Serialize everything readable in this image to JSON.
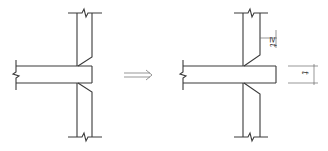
{
  "figure": {
    "left_detail": {
      "name": "original-joint",
      "description": "Wall with slab end flush to wall face, haunches at both slab faces"
    },
    "arrow": {
      "symbol": "⟹",
      "meaning": "transforms-to"
    },
    "right_detail": {
      "name": "modified-joint",
      "description": "Slab extended beyond wall face, haunches moved up",
      "dimensions": [
        {
          "label": "≥t",
          "meaning": "haunch offset at least slab thickness"
        },
        {
          "label": "t",
          "meaning": "slab thickness"
        }
      ]
    }
  },
  "labels": {
    "ge_t": "≥t",
    "t": "t"
  }
}
